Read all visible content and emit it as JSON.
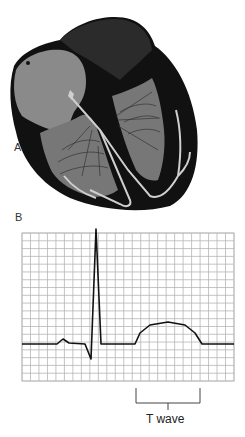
{
  "figure": {
    "panels": [
      {
        "id": "A",
        "label": "A",
        "description": "Heart cross-section with conduction system"
      },
      {
        "id": "B",
        "label": "B",
        "description": "ECG trace on grid"
      }
    ],
    "annotation": {
      "label": "T wave"
    },
    "colors": {
      "heart_outer": "#111111",
      "heart_wall": "#2b2b2b",
      "chamber_fill": "#7a7a7a",
      "conduction": "#c8c8c8",
      "grid": "#b5b5b5",
      "trace": "#111111",
      "text": "#222222"
    }
  },
  "chart_data": {
    "type": "line",
    "title": "",
    "xlabel": "",
    "ylabel": "",
    "grid": true,
    "grid_cells": {
      "columns": 25,
      "rows": 19
    },
    "series": [
      {
        "name": "ECG",
        "points_px": [
          [
            22,
            344
          ],
          [
            57,
            344
          ],
          [
            63,
            339
          ],
          [
            69,
            343
          ],
          [
            85,
            344
          ],
          [
            91,
            359
          ],
          [
            96,
            229
          ],
          [
            101,
            344
          ],
          [
            135,
            344
          ],
          [
            140,
            333
          ],
          [
            150,
            325
          ],
          [
            168,
            322
          ],
          [
            185,
            325
          ],
          [
            195,
            333
          ],
          [
            202,
            344
          ],
          [
            234,
            344
          ]
        ]
      }
    ],
    "annotations": [
      {
        "text": "T wave",
        "bracket_x": [
          136,
          200
        ]
      }
    ]
  }
}
